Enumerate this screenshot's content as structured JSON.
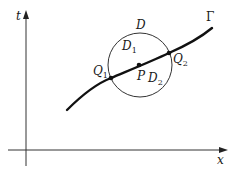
{
  "figure": {
    "axes": {
      "x_label": "x",
      "y_label": "t"
    },
    "curve": {
      "label": "Γ"
    },
    "disk": {
      "label": "D"
    },
    "regions": [
      {
        "label": "D",
        "sub": "1"
      },
      {
        "label": "D",
        "sub": "2"
      }
    ],
    "points": [
      {
        "label": "Q",
        "sub": "1"
      },
      {
        "label": "Q",
        "sub": "2"
      },
      {
        "label": "P"
      }
    ],
    "colors": {
      "ink": "#1a1a1a",
      "background": "#ffffff"
    }
  }
}
